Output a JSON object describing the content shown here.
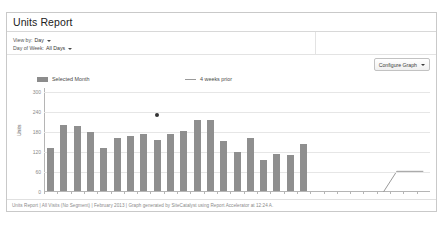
{
  "panel": {
    "title": "Units Report"
  },
  "filters": [
    {
      "label": "View by:",
      "value": "Day",
      "caret": "chevron-down-icon"
    },
    {
      "label": "Day of Week:",
      "value": "All Days",
      "caret": "chevron-down-icon"
    }
  ],
  "toolbar": {
    "configure_label": "Configure Graph",
    "configure_caret": "chevron-down-icon"
  },
  "legend": [
    {
      "label": "Selected Month",
      "type": "bar",
      "color": "#8f8f8f"
    },
    {
      "label": "4 weeks prior",
      "type": "line",
      "color": "#9a9a9a"
    }
  ],
  "footer": {
    "text": "Units Report | All Visits (No Segment) | February 2013 | Graph generated by SiteCatalyst using Report Accelerator at 12:24 A."
  },
  "chart_data": {
    "type": "bar",
    "title": "Units Report",
    "xlabel": "Feb 2013",
    "ylabel": "Units",
    "ylim": [
      0,
      300
    ],
    "yticks": [
      300,
      240,
      180,
      120,
      60,
      0
    ],
    "grid": true,
    "legend_position": "top",
    "month_label": "Feb 2013",
    "categories": [
      "1",
      "2",
      "3",
      "4",
      "5",
      "6",
      "7",
      "8",
      "9",
      "10",
      "11",
      "12",
      "13",
      "14",
      "15",
      "16",
      "17",
      "18",
      "19",
      "20",
      "21",
      "22",
      "23",
      "24",
      "25",
      "26",
      "27",
      "28",
      "1"
    ],
    "series": [
      {
        "name": "Selected Month",
        "type": "bar",
        "color": "#8f8f8f",
        "values": [
          128,
          197,
          196,
          176,
          130,
          158,
          166,
          170,
          152,
          170,
          180,
          213,
          212,
          150,
          118,
          160,
          92,
          110,
          108,
          140,
          null,
          null,
          null,
          null,
          null,
          null,
          null,
          null,
          null
        ]
      },
      {
        "name": "4 weeks prior",
        "type": "line",
        "color": "#9a9a9a",
        "values": [
          null,
          null,
          null,
          null,
          null,
          null,
          null,
          null,
          null,
          null,
          null,
          null,
          null,
          null,
          null,
          null,
          null,
          null,
          null,
          null,
          null,
          null,
          null,
          null,
          null,
          0,
          62,
          62,
          62
        ]
      }
    ],
    "annotations": [
      {
        "name": "data-point-marker",
        "category": "9",
        "value": 232,
        "color": "#333333"
      }
    ]
  }
}
